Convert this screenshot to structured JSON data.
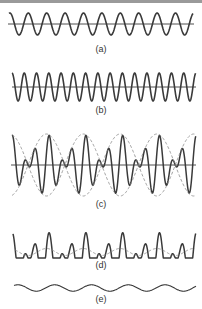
{
  "figure": {
    "panels": [
      {
        "id": "a",
        "label": "(a)",
        "description": "carrier sine wave",
        "cycles": 10
      },
      {
        "id": "b",
        "label": "(b)",
        "description": "higher-frequency sine wave",
        "cycles": 15
      },
      {
        "id": "c",
        "label": "(c)",
        "description": "sum of (a) and (b) showing beats with dashed envelope"
      },
      {
        "id": "d",
        "label": "(d)",
        "description": "rectified/detected pulse train with dashed low-frequency component"
      },
      {
        "id": "e",
        "label": "(e)",
        "description": "recovered low-frequency beat signal"
      }
    ],
    "colors": {
      "trace": "#3a3a3a",
      "envelope": "#8a8a8a",
      "axis": "#3a3a3a",
      "topbar": "#9a9a9a"
    }
  }
}
